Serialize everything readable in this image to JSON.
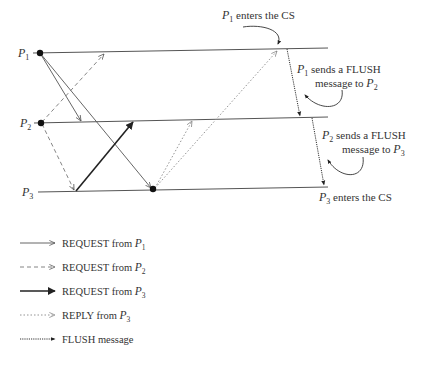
{
  "diagram": {
    "type": "space-time diagram",
    "processes": [
      {
        "id": "P1",
        "name": "P",
        "sub": "1"
      },
      {
        "id": "P2",
        "name": "P",
        "sub": "2"
      },
      {
        "id": "P3",
        "name": "P",
        "sub": "3"
      }
    ],
    "annotations": {
      "p1_enters": {
        "proc": "P",
        "sub": "1",
        "text": " enters the CS"
      },
      "p1_flush_line1": {
        "proc": "P",
        "sub": "1",
        "text": " sends a FLUSH"
      },
      "p1_flush_line2": {
        "text": "message to ",
        "proc": "P",
        "sub": "2"
      },
      "p2_flush_line1": {
        "proc": "P",
        "sub": "2",
        "text": " sends a FLUSH"
      },
      "p2_flush_line2": {
        "text": "message to ",
        "proc": "P",
        "sub": "3"
      },
      "p3_enters": {
        "proc": "P",
        "sub": "3",
        "text": " enters the CS"
      }
    },
    "messages": [
      {
        "type": "REQUEST",
        "from": "P1",
        "to": "P2",
        "style": "solid-thin"
      },
      {
        "type": "REQUEST",
        "from": "P1",
        "to": "P3",
        "style": "solid-thin"
      },
      {
        "type": "REQUEST",
        "from": "P2",
        "to": "P1",
        "style": "dashed"
      },
      {
        "type": "REQUEST",
        "from": "P2",
        "to": "P3",
        "style": "dashed"
      },
      {
        "type": "REQUEST",
        "from": "P3",
        "to": "P2",
        "style": "solid-thick"
      },
      {
        "type": "REPLY",
        "from": "P3",
        "to": "P2",
        "style": "dotted"
      },
      {
        "type": "REPLY",
        "from": "P3",
        "to": "P1",
        "style": "dotted"
      },
      {
        "type": "FLUSH",
        "from": "P1",
        "to": "P2",
        "style": "flush"
      },
      {
        "type": "FLUSH",
        "from": "P2",
        "to": "P3",
        "style": "flush"
      }
    ]
  },
  "legend": {
    "items": [
      {
        "text": "REQUEST from ",
        "proc": "P",
        "sub": "1",
        "style": "solid-thin"
      },
      {
        "text": "REQUEST from ",
        "proc": "P",
        "sub": "2",
        "style": "dashed"
      },
      {
        "text": "REQUEST from ",
        "proc": "P",
        "sub": "3",
        "style": "solid-thick"
      },
      {
        "text": "REPLY from ",
        "proc": "P",
        "sub": "3",
        "style": "dotted"
      },
      {
        "text": "FLUSH message",
        "proc": "",
        "sub": "",
        "style": "flush"
      }
    ]
  },
  "colors": {
    "line": "#555555",
    "text": "#333333",
    "dot": "#111111"
  }
}
